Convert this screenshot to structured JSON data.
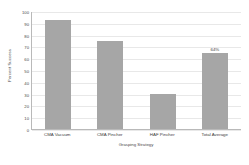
{
  "chart_data": {
    "type": "bar",
    "title": "",
    "xlabel": "Grasping Strategy",
    "ylabel": "Percent Success",
    "categories": [
      "CMA Vacuum",
      "CMA Pincher",
      "HAF Pincher",
      "Total Average"
    ],
    "values": [
      92,
      75,
      30,
      64
    ],
    "data_labels": [
      "",
      "",
      "",
      "64%"
    ],
    "ylim": [
      0,
      100
    ],
    "yticks": [
      100,
      90,
      80,
      70,
      60,
      50,
      40,
      30,
      20,
      10,
      0
    ],
    "ytick_labels": [
      "100",
      "90",
      "80",
      "70",
      "60",
      "50",
      "40",
      "30",
      "20",
      "10",
      "0"
    ],
    "grid": true,
    "legend": false,
    "bar_color": "#a6a6a6",
    "gridline_color": "#e8e8e8",
    "axis_color": "#b9b9b9",
    "background_color": "#ffffff"
  }
}
